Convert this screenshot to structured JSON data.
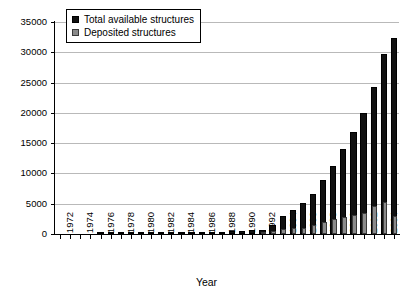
{
  "chart_data": {
    "type": "bar",
    "title": "",
    "xlabel": "Year",
    "ylabel": "",
    "ylim": [
      0,
      35000
    ],
    "ytick_values": [
      0,
      5000,
      10000,
      15000,
      20000,
      25000,
      30000,
      35000
    ],
    "ytick_labels": [
      "0",
      "5000",
      "10000",
      "15000",
      "20000",
      "25000",
      "30000",
      "35000"
    ],
    "grid": true,
    "legend_position": "top-left",
    "categories": [
      "1972",
      "1973",
      "1974",
      "1975",
      "1976",
      "1977",
      "1978",
      "1979",
      "1980",
      "1981",
      "1982",
      "1983",
      "1984",
      "1985",
      "1986",
      "1987",
      "1988",
      "1989",
      "1990",
      "1991",
      "1992",
      "1993",
      "1994",
      "1995",
      "1996",
      "1997",
      "1998",
      "1999",
      "2000",
      "2001",
      "2002",
      "2003",
      "2004",
      "2005"
    ],
    "xtick_labels_shown": [
      "1972",
      "1974",
      "1976",
      "1978",
      "1980",
      "1982",
      "1984",
      "1986",
      "1988",
      "1990",
      "1992",
      "1994",
      "1996",
      "1998",
      "2000",
      "2002",
      "2004"
    ],
    "series": [
      {
        "name": "Total available structures",
        "color": "#111111",
        "values": [
          0,
          0,
          0,
          0,
          15,
          40,
          60,
          75,
          95,
          110,
          130,
          155,
          180,
          220,
          270,
          320,
          380,
          450,
          530,
          620,
          740,
          1450,
          2900,
          3900,
          5100,
          6600,
          8900,
          11200,
          14000,
          16900,
          20000,
          24300,
          29700,
          32300
        ]
      },
      {
        "name": "Deposited structures",
        "color": "#8a8a8a",
        "values": [
          0,
          0,
          0,
          0,
          0,
          0,
          0,
          0,
          0,
          0,
          0,
          0,
          0,
          0,
          0,
          0,
          0,
          0,
          0,
          0,
          180,
          550,
          900,
          950,
          1050,
          1550,
          2000,
          2400,
          2800,
          3100,
          3400,
          4600,
          5300,
          2900
        ]
      }
    ]
  },
  "legend": {
    "items": [
      {
        "label": "Total available structures",
        "swatch": "total"
      },
      {
        "label": "Deposited structures",
        "swatch": "deposited"
      }
    ]
  },
  "axis": {
    "x_title": "Year"
  }
}
